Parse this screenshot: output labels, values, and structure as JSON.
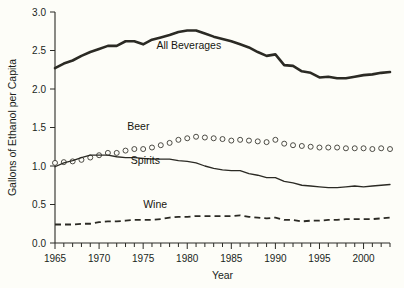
{
  "chart_data": {
    "type": "line",
    "title": "",
    "xlabel": "Year",
    "ylabel": "Gallons of Ethanol per Capita",
    "xlim": [
      1965,
      2003
    ],
    "ylim": [
      0.0,
      3.0
    ],
    "ytick_values": [
      0.0,
      0.5,
      1.0,
      1.5,
      2.0,
      2.5,
      3.0
    ],
    "ytick_labels": [
      "0.0",
      "0.5",
      "1.0",
      "1.5",
      "2.0",
      "2.5",
      "3.0"
    ],
    "xtick_values": [
      1965,
      1970,
      1975,
      1980,
      1985,
      1990,
      1995,
      2000
    ],
    "xtick_labels": [
      "1965",
      "1970",
      "1975",
      "1980",
      "1985",
      "1990",
      "1995",
      "2000"
    ],
    "minor_xticks_every": 1,
    "grid": false,
    "legend_position": "inline-annotations",
    "x": [
      1965,
      1966,
      1967,
      1968,
      1969,
      1970,
      1971,
      1972,
      1973,
      1974,
      1975,
      1976,
      1977,
      1978,
      1979,
      1980,
      1981,
      1982,
      1983,
      1984,
      1985,
      1986,
      1987,
      1988,
      1989,
      1990,
      1991,
      1992,
      1993,
      1994,
      1995,
      1996,
      1997,
      1998,
      1999,
      2000,
      2001,
      2002,
      2003
    ],
    "series": [
      {
        "name": "All Beverages",
        "style": "solid-thick",
        "label_x": 1976.5,
        "label_y": 2.52,
        "values": [
          2.27,
          2.33,
          2.37,
          2.43,
          2.48,
          2.52,
          2.56,
          2.56,
          2.62,
          2.62,
          2.58,
          2.64,
          2.67,
          2.7,
          2.74,
          2.76,
          2.76,
          2.72,
          2.68,
          2.65,
          2.62,
          2.58,
          2.54,
          2.48,
          2.43,
          2.45,
          2.31,
          2.3,
          2.23,
          2.21,
          2.15,
          2.16,
          2.14,
          2.14,
          2.16,
          2.18,
          2.19,
          2.21,
          2.22
        ]
      },
      {
        "name": "Beer",
        "style": "circles",
        "label_x": 1973.2,
        "label_y": 1.47,
        "values": [
          1.04,
          1.05,
          1.06,
          1.08,
          1.11,
          1.14,
          1.17,
          1.17,
          1.2,
          1.22,
          1.22,
          1.24,
          1.27,
          1.3,
          1.34,
          1.36,
          1.38,
          1.37,
          1.36,
          1.35,
          1.33,
          1.34,
          1.33,
          1.32,
          1.31,
          1.34,
          1.29,
          1.27,
          1.26,
          1.25,
          1.24,
          1.24,
          1.24,
          1.23,
          1.23,
          1.23,
          1.22,
          1.23,
          1.22
        ]
      },
      {
        "name": "Spirits",
        "style": "solid-thin",
        "label_x": 1973.6,
        "label_y": 1.02,
        "values": [
          0.99,
          1.04,
          1.07,
          1.11,
          1.14,
          1.14,
          1.14,
          1.12,
          1.11,
          1.11,
          1.1,
          1.09,
          1.09,
          1.09,
          1.07,
          1.06,
          1.04,
          1.0,
          0.97,
          0.95,
          0.94,
          0.94,
          0.9,
          0.88,
          0.85,
          0.85,
          0.8,
          0.78,
          0.75,
          0.74,
          0.73,
          0.72,
          0.72,
          0.73,
          0.74,
          0.73,
          0.74,
          0.75,
          0.76
        ]
      },
      {
        "name": "Wine",
        "style": "dashed",
        "label_x": 1975.0,
        "label_y": 0.46,
        "values": [
          0.24,
          0.24,
          0.24,
          0.25,
          0.25,
          0.27,
          0.28,
          0.28,
          0.29,
          0.3,
          0.3,
          0.3,
          0.31,
          0.33,
          0.34,
          0.34,
          0.35,
          0.35,
          0.35,
          0.35,
          0.35,
          0.36,
          0.34,
          0.33,
          0.32,
          0.33,
          0.3,
          0.3,
          0.28,
          0.29,
          0.29,
          0.3,
          0.3,
          0.31,
          0.31,
          0.31,
          0.31,
          0.32,
          0.33
        ]
      }
    ]
  }
}
